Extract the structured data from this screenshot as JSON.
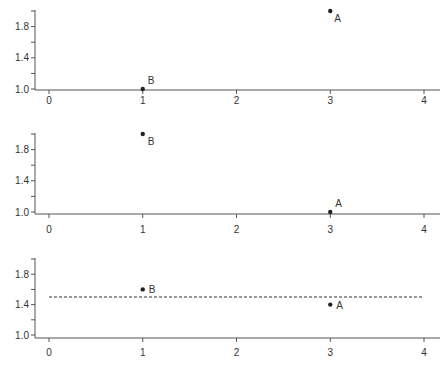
{
  "colors": {
    "axis": "#555555",
    "point": "#222222",
    "text": "#333333",
    "dashed_line": "#333333",
    "background": "#ffffff"
  },
  "chart_data": [
    {
      "type": "scatter",
      "title": "",
      "xlabel": "",
      "ylabel": "",
      "xlim": [
        0,
        4
      ],
      "ylim": [
        1.0,
        2.0
      ],
      "x_ticks": [
        0,
        1,
        2,
        3,
        4
      ],
      "x_tick_labels": [
        "0",
        "1",
        "2",
        "3",
        "4"
      ],
      "y_ticks": [
        1.0,
        1.2,
        1.4,
        1.6,
        1.8,
        2.0
      ],
      "y_tick_labels": [
        "1.0",
        "",
        "1.4",
        "",
        "1.8",
        ""
      ],
      "grid": false,
      "points": [
        {
          "label": "B",
          "x": 1,
          "y": 1.0
        },
        {
          "label": "A",
          "x": 3,
          "y": 2.0
        }
      ]
    },
    {
      "type": "scatter",
      "title": "",
      "xlabel": "",
      "ylabel": "",
      "xlim": [
        0,
        4
      ],
      "ylim": [
        1.0,
        2.0
      ],
      "x_ticks": [
        0,
        1,
        2,
        3,
        4
      ],
      "x_tick_labels": [
        "0",
        "1",
        "2",
        "3",
        "4"
      ],
      "y_ticks": [
        1.0,
        1.2,
        1.4,
        1.6,
        1.8,
        2.0
      ],
      "y_tick_labels": [
        "1.0",
        "",
        "1.4",
        "",
        "1.8",
        ""
      ],
      "grid": false,
      "points": [
        {
          "label": "B",
          "x": 1,
          "y": 2.0
        },
        {
          "label": "A",
          "x": 3,
          "y": 1.0
        }
      ]
    },
    {
      "type": "scatter",
      "title": "",
      "xlabel": "",
      "ylabel": "",
      "xlim": [
        0,
        4
      ],
      "ylim": [
        1.0,
        2.0
      ],
      "x_ticks": [
        0,
        1,
        2,
        3,
        4
      ],
      "x_tick_labels": [
        "0",
        "1",
        "2",
        "3",
        "4"
      ],
      "y_ticks": [
        1.0,
        1.2,
        1.4,
        1.6,
        1.8,
        2.0
      ],
      "y_tick_labels": [
        "1.0",
        "",
        "1.4",
        "",
        "1.8",
        ""
      ],
      "grid": false,
      "points": [
        {
          "label": "B",
          "x": 1,
          "y": 1.6
        },
        {
          "label": "A",
          "x": 3,
          "y": 1.4
        }
      ],
      "reference_line": {
        "style": "dashed",
        "y": 1.5,
        "x_range": [
          0,
          4
        ]
      }
    }
  ]
}
